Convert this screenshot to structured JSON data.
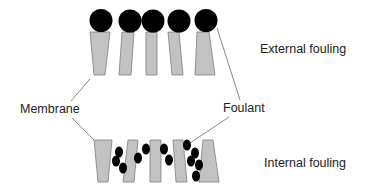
{
  "diagram": {
    "title": "",
    "labels": {
      "external": "External fouling",
      "internal": "Internal fouling",
      "membrane": "Membrane",
      "foulant": "Foulant"
    },
    "colors": {
      "membrane_fill": "#c2c2c2",
      "membrane_stroke": "#7d7d7d",
      "foulant": "#000000",
      "text": "#222222",
      "leader_line": "#6a6a6a"
    },
    "external_fouling": {
      "membrane_segments": 5,
      "foulant_particles": 5,
      "particle_position": "on top of membrane surface"
    },
    "internal_fouling": {
      "membrane_segments": 5,
      "foulant_particles": 12,
      "particle_position": "inside membrane pores"
    },
    "connectors": [
      {
        "from": "Membrane",
        "to": "external membrane segment 1"
      },
      {
        "from": "Membrane",
        "to": "internal membrane segment 1"
      },
      {
        "from": "Foulant",
        "to": "external foulant particle 5"
      },
      {
        "from": "Foulant",
        "to": "internal foulant particle"
      }
    ]
  }
}
